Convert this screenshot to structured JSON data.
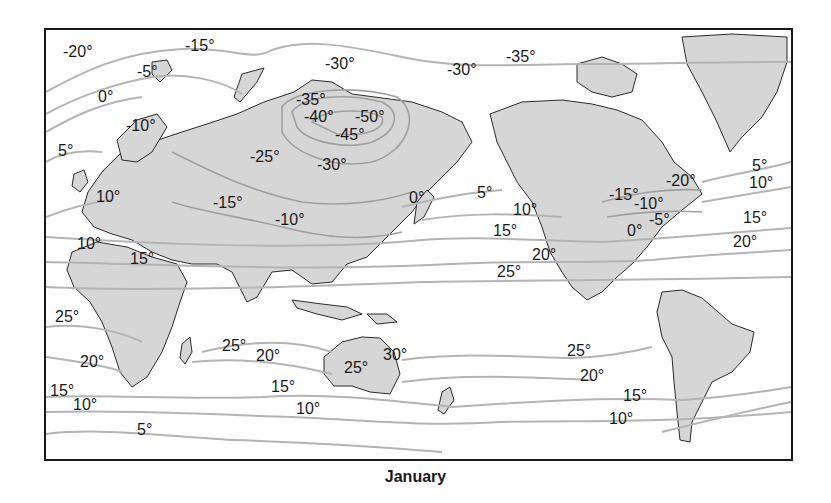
{
  "map": {
    "caption": "January",
    "type": "isotherm world map (Pacific-centered)",
    "colors": {
      "land": "#d6d6d6",
      "isotherm": "#b4b4b4",
      "frame": "#1a1a1a",
      "ocean": "#ffffff"
    },
    "labels": [
      {
        "text": "-20°",
        "x": 63,
        "y": 52
      },
      {
        "text": "-15°",
        "x": 185,
        "y": 46
      },
      {
        "text": "-5°",
        "x": 137,
        "y": 72
      },
      {
        "text": "0°",
        "x": 98,
        "y": 97
      },
      {
        "text": "-10°",
        "x": 126,
        "y": 126
      },
      {
        "text": "5°",
        "x": 58,
        "y": 151
      },
      {
        "text": "-30°",
        "x": 325,
        "y": 64
      },
      {
        "text": "-30°",
        "x": 447,
        "y": 70
      },
      {
        "text": "-35°",
        "x": 506,
        "y": 57
      },
      {
        "text": "-35°",
        "x": 296,
        "y": 100
      },
      {
        "text": "-40°",
        "x": 304,
        "y": 117
      },
      {
        "text": "-50°",
        "x": 355,
        "y": 117
      },
      {
        "text": "-45°",
        "x": 335,
        "y": 135
      },
      {
        "text": "-25°",
        "x": 250,
        "y": 157
      },
      {
        "text": "-30°",
        "x": 317,
        "y": 165
      },
      {
        "text": "10°",
        "x": 96,
        "y": 197
      },
      {
        "text": "-15°",
        "x": 213,
        "y": 203
      },
      {
        "text": "-10°",
        "x": 275,
        "y": 220
      },
      {
        "text": "10°",
        "x": 77,
        "y": 244
      },
      {
        "text": "15°",
        "x": 130,
        "y": 259
      },
      {
        "text": "0°",
        "x": 409,
        "y": 198
      },
      {
        "text": "5°",
        "x": 477,
        "y": 193
      },
      {
        "text": "10°",
        "x": 513,
        "y": 210
      },
      {
        "text": "15°",
        "x": 493,
        "y": 231
      },
      {
        "text": "20°",
        "x": 532,
        "y": 255
      },
      {
        "text": "25°",
        "x": 497,
        "y": 272
      },
      {
        "text": "-20°",
        "x": 666,
        "y": 181
      },
      {
        "text": "-15°",
        "x": 609,
        "y": 195
      },
      {
        "text": "-10°",
        "x": 634,
        "y": 204
      },
      {
        "text": "-5°",
        "x": 649,
        "y": 220
      },
      {
        "text": "0°",
        "x": 627,
        "y": 231
      },
      {
        "text": "5°",
        "x": 752,
        "y": 166
      },
      {
        "text": "10°",
        "x": 749,
        "y": 183
      },
      {
        "text": "15°",
        "x": 743,
        "y": 218
      },
      {
        "text": "20°",
        "x": 733,
        "y": 242
      },
      {
        "text": "25°",
        "x": 55,
        "y": 317
      },
      {
        "text": "20°",
        "x": 80,
        "y": 362
      },
      {
        "text": "15°",
        "x": 50,
        "y": 391
      },
      {
        "text": "10°",
        "x": 73,
        "y": 405
      },
      {
        "text": "5°",
        "x": 137,
        "y": 430
      },
      {
        "text": "25°",
        "x": 222,
        "y": 346
      },
      {
        "text": "20°",
        "x": 256,
        "y": 356
      },
      {
        "text": "15°",
        "x": 271,
        "y": 387
      },
      {
        "text": "10°",
        "x": 296,
        "y": 409
      },
      {
        "text": "30°",
        "x": 383,
        "y": 355
      },
      {
        "text": "25°",
        "x": 344,
        "y": 368
      },
      {
        "text": "25°",
        "x": 567,
        "y": 351
      },
      {
        "text": "20°",
        "x": 580,
        "y": 376
      },
      {
        "text": "15°",
        "x": 623,
        "y": 396
      },
      {
        "text": "10°",
        "x": 609,
        "y": 419
      }
    ]
  }
}
